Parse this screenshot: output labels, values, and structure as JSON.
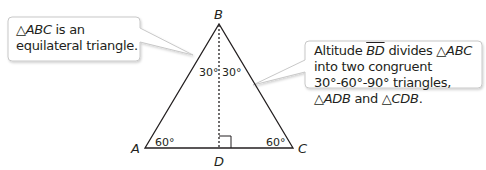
{
  "callouts": {
    "left": {
      "tri": "△",
      "name": "ABC",
      "rest": " is an equilateral triangle."
    },
    "right": {
      "p1": "Altitude ",
      "seg": "BD",
      "p2": " divides ",
      "tri1": "△",
      "name1": "ABC",
      "p3": " into two congruent 30°-60°-90° triangles, ",
      "tri2": "△",
      "name2": "ADB",
      "p4": " and ",
      "tri3": "△",
      "name3": "CDB",
      "p5": "."
    }
  },
  "diagram": {
    "vertices": {
      "A": "A",
      "B": "B",
      "C": "C",
      "D": "D"
    },
    "angles": {
      "ABD": "30°",
      "DBC": "30°",
      "A": "60°",
      "C": "60°"
    },
    "colors": {
      "line": "#231f20",
      "callout_border": "#c8c8c8"
    }
  }
}
